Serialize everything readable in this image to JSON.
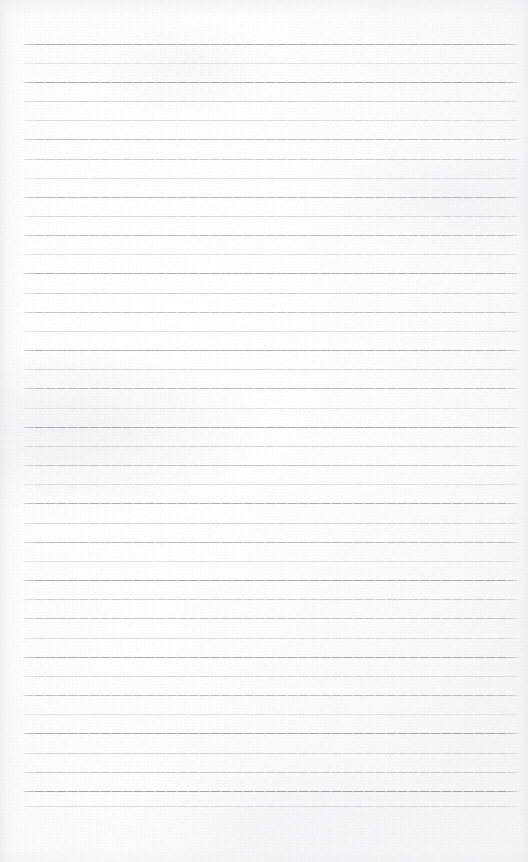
{
  "document": {
    "kind": "scanned-ruled-notebook-page",
    "title": "Blank lined notebook page",
    "content_text": "",
    "has_handwriting": false,
    "has_printed_text": false,
    "page_width_px": 528,
    "page_height_px": 862
  },
  "paper": {
    "base_color": "#fafafa",
    "tint_color": "#f6f6f7",
    "edge_shadow_color": "#e4e4e6",
    "left_margin_px": 22,
    "right_margin_px": 7,
    "top_blank_px": 44,
    "bottom_blank_px": 56
  },
  "ruling": {
    "style": "wide-ruled-horizontal",
    "line_count": 41,
    "first_line_y_px": 44,
    "spacing_px": 19.1,
    "line_start_x_px": 22,
    "line_end_x_px": 521,
    "line_thickness_px": 1,
    "dark_line_color": "#b0b0b4",
    "light_line_color": "#d2d2d6",
    "lines": [
      {
        "index": 1,
        "y": 44,
        "color": "#a9a9ad",
        "opacity": 0.92
      },
      {
        "index": 2,
        "y": 63,
        "color": "#cfcfd3",
        "opacity": 0.6
      },
      {
        "index": 3,
        "y": 82,
        "color": "#a3a3a7",
        "opacity": 0.95
      },
      {
        "index": 4,
        "y": 101,
        "color": "#c2c2c6",
        "opacity": 0.7
      },
      {
        "index": 5,
        "y": 120,
        "color": "#c9c9cd",
        "opacity": 0.64
      },
      {
        "index": 6,
        "y": 139,
        "color": "#b4b4b8",
        "opacity": 0.84
      },
      {
        "index": 7,
        "y": 159,
        "color": "#bdbdc1",
        "opacity": 0.76
      },
      {
        "index": 8,
        "y": 178,
        "color": "#cbcbcf",
        "opacity": 0.62
      },
      {
        "index": 9,
        "y": 197,
        "color": "#aeaeb2",
        "opacity": 0.88
      },
      {
        "index": 10,
        "y": 216,
        "color": "#c6c6ca",
        "opacity": 0.68
      },
      {
        "index": 11,
        "y": 235,
        "color": "#b2b2b6",
        "opacity": 0.86
      },
      {
        "index": 12,
        "y": 254,
        "color": "#cdcdd1",
        "opacity": 0.6
      },
      {
        "index": 13,
        "y": 273,
        "color": "#a8a8ac",
        "opacity": 0.92
      },
      {
        "index": 14,
        "y": 293,
        "color": "#c0c0c4",
        "opacity": 0.72
      },
      {
        "index": 15,
        "y": 312,
        "color": "#b6b6ba",
        "opacity": 0.82
      },
      {
        "index": 16,
        "y": 331,
        "color": "#cacace",
        "opacity": 0.63
      },
      {
        "index": 17,
        "y": 350,
        "color": "#ababaf",
        "opacity": 0.9
      },
      {
        "index": 18,
        "y": 369,
        "color": "#c4c4c8",
        "opacity": 0.69
      },
      {
        "index": 19,
        "y": 388,
        "color": "#b0b0b4",
        "opacity": 0.87
      },
      {
        "index": 20,
        "y": 408,
        "color": "#cecdd2",
        "opacity": 0.59
      },
      {
        "index": 21,
        "y": 427,
        "color": "#a7a7ab",
        "opacity": 0.93
      },
      {
        "index": 22,
        "y": 446,
        "color": "#c1c1c5",
        "opacity": 0.71
      },
      {
        "index": 23,
        "y": 465,
        "color": "#b8b8bc",
        "opacity": 0.8
      },
      {
        "index": 24,
        "y": 484,
        "color": "#ccccd0",
        "opacity": 0.62
      },
      {
        "index": 25,
        "y": 503,
        "color": "#a9a9ad",
        "opacity": 0.91
      },
      {
        "index": 26,
        "y": 523,
        "color": "#c3c3c7",
        "opacity": 0.7
      },
      {
        "index": 27,
        "y": 542,
        "color": "#b1b1b5",
        "opacity": 0.86
      },
      {
        "index": 28,
        "y": 561,
        "color": "#cdcdd1",
        "opacity": 0.6
      },
      {
        "index": 29,
        "y": 580,
        "color": "#a5a5a9",
        "opacity": 0.94
      },
      {
        "index": 30,
        "y": 599,
        "color": "#bfbfc3",
        "opacity": 0.73
      },
      {
        "index": 31,
        "y": 618,
        "color": "#b5b5b9",
        "opacity": 0.83
      },
      {
        "index": 32,
        "y": 638,
        "color": "#c8c8cc",
        "opacity": 0.65
      },
      {
        "index": 33,
        "y": 657,
        "color": "#a6a6aa",
        "opacity": 0.93
      },
      {
        "index": 34,
        "y": 676,
        "color": "#c5c5c9",
        "opacity": 0.67
      },
      {
        "index": 35,
        "y": 695,
        "color": "#b3b3b7",
        "opacity": 0.85
      },
      {
        "index": 36,
        "y": 714,
        "color": "#cfcfd3",
        "opacity": 0.58
      },
      {
        "index": 37,
        "y": 733,
        "color": "#a4a4a8",
        "opacity": 0.95
      },
      {
        "index": 38,
        "y": 753,
        "color": "#c2c2c6",
        "opacity": 0.7
      },
      {
        "index": 39,
        "y": 772,
        "color": "#bcbcc0",
        "opacity": 0.77
      },
      {
        "index": 40,
        "y": 791,
        "color": "#a2a2a6",
        "opacity": 0.96
      },
      {
        "index": 41,
        "y": 806,
        "color": "#c9c9cd",
        "opacity": 0.64
      }
    ]
  }
}
